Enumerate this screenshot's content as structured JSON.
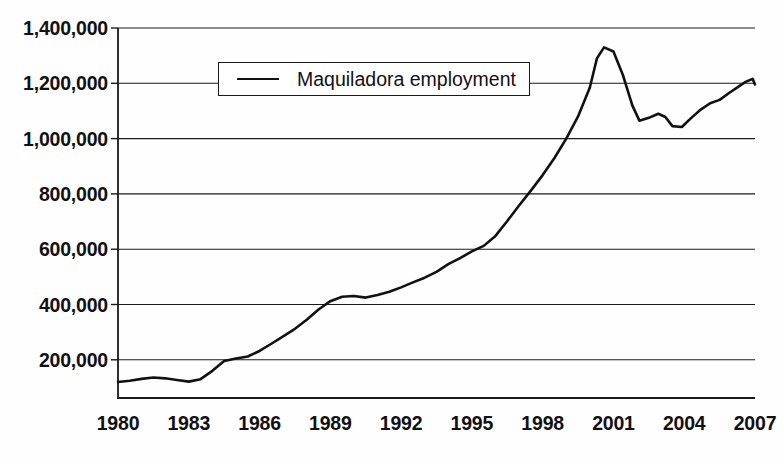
{
  "chart_data": {
    "type": "line",
    "title": "",
    "subtitle": "",
    "xlabel": "",
    "ylabel": "",
    "grid": "horizontal",
    "legend_position": "top-center",
    "xlim": [
      1980,
      2007
    ],
    "ylim": [
      0,
      1400000
    ],
    "ytick_labels": [
      "1,400,000",
      "1,200,000",
      "1,000,000",
      "800,000",
      "600,000",
      "400,000",
      "200,000"
    ],
    "ytick_values": [
      1400000,
      1200000,
      1000000,
      800000,
      600000,
      400000,
      200000
    ],
    "xtick_labels": [
      "1980",
      "1983",
      "1986",
      "1989",
      "1992",
      "1995",
      "1998",
      "2001",
      "2004",
      "2007"
    ],
    "xtick_values": [
      1980,
      1983,
      1986,
      1989,
      1992,
      1995,
      1998,
      2001,
      2004,
      2007
    ],
    "series": [
      {
        "name": "Maquiladora employment",
        "color": "#111111",
        "x": [
          1980.0,
          1980.5,
          1981.0,
          1981.5,
          1982.0,
          1982.5,
          1983.0,
          1983.5,
          1984.0,
          1984.5,
          1985.0,
          1985.5,
          1986.0,
          1986.5,
          1987.0,
          1987.5,
          1988.0,
          1988.5,
          1989.0,
          1989.5,
          1990.0,
          1990.5,
          1991.0,
          1991.5,
          1992.0,
          1992.5,
          1993.0,
          1993.5,
          1994.0,
          1994.5,
          1995.0,
          1995.5,
          1996.0,
          1996.5,
          1997.0,
          1997.5,
          1998.0,
          1998.5,
          1999.0,
          1999.5,
          2000.0,
          2000.3,
          2000.6,
          2001.0,
          2001.4,
          2001.8,
          2002.1,
          2002.5,
          2002.9,
          2003.2,
          2003.5,
          2003.9,
          2004.3,
          2004.7,
          2005.1,
          2005.5,
          2005.9,
          2006.3,
          2006.6,
          2006.9,
          2007.0
        ],
        "y": [
          120000,
          124000,
          131000,
          136000,
          133000,
          127000,
          121000,
          130000,
          160000,
          196000,
          205000,
          212000,
          232000,
          258000,
          285000,
          312000,
          345000,
          382000,
          412000,
          428000,
          431000,
          425000,
          434000,
          446000,
          462000,
          480000,
          497000,
          518000,
          546000,
          568000,
          592000,
          612000,
          648000,
          702000,
          758000,
          812000,
          868000,
          930000,
          1000000,
          1080000,
          1185000,
          1290000,
          1330000,
          1315000,
          1230000,
          1120000,
          1065000,
          1075000,
          1090000,
          1078000,
          1045000,
          1042000,
          1075000,
          1105000,
          1128000,
          1140000,
          1165000,
          1188000,
          1205000,
          1216000,
          1196000
        ]
      }
    ],
    "annotations": []
  },
  "legend": {
    "entries": [
      {
        "label": "Maquiladora employment",
        "marker": "line-swatch"
      }
    ]
  },
  "axes": {
    "y_axis_name": "employment-axis",
    "x_axis_name": "year-axis"
  }
}
